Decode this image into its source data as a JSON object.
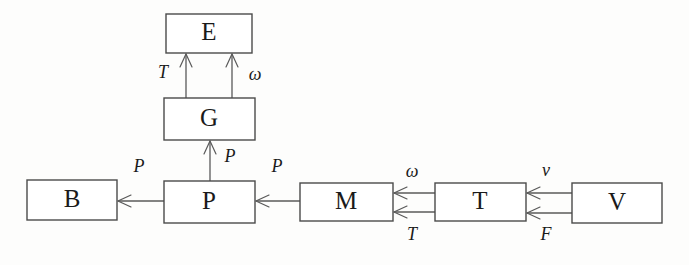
{
  "diagram": {
    "background_color": "#fdfdfc",
    "line_color": "#5a5a5a",
    "box_fill": "#ffffff",
    "text_color": "#1a1a1a",
    "nodes": [
      {
        "id": "E",
        "label": "E",
        "x": 166,
        "y": 14,
        "w": 86,
        "h": 39,
        "cx": 209,
        "cy": 33
      },
      {
        "id": "G",
        "label": "G",
        "x": 164,
        "y": 98,
        "w": 91,
        "h": 42,
        "cx": 209,
        "cy": 119
      },
      {
        "id": "B",
        "label": "B",
        "x": 27,
        "y": 180,
        "w": 90,
        "h": 40,
        "cx": 72,
        "cy": 200
      },
      {
        "id": "P",
        "label": "P",
        "x": 164,
        "y": 181,
        "w": 91,
        "h": 42,
        "cx": 209,
        "cy": 202
      },
      {
        "id": "M",
        "label": "M",
        "x": 300,
        "y": 183,
        "w": 93,
        "h": 38,
        "cx": 346,
        "cy": 202
      },
      {
        "id": "T",
        "label": "T",
        "x": 435,
        "y": 183,
        "w": 91,
        "h": 38,
        "cx": 480,
        "cy": 202
      },
      {
        "id": "V",
        "label": "V",
        "x": 572,
        "y": 183,
        "w": 90,
        "h": 40,
        "cx": 617,
        "cy": 203
      }
    ],
    "edges": [
      {
        "id": "G-to-E-left",
        "from": "G",
        "to": "E",
        "label": "T",
        "label_x": 163,
        "label_y": 74,
        "x1": 186,
        "y1": 98,
        "x2": 186,
        "y2": 54,
        "direction": "up"
      },
      {
        "id": "G-to-E-right",
        "from": "G",
        "to": "E",
        "label": "ω",
        "label_x": 255,
        "label_y": 76,
        "x1": 232,
        "y1": 98,
        "x2": 232,
        "y2": 54,
        "direction": "up"
      },
      {
        "id": "P-to-G",
        "from": "P",
        "to": "G",
        "label": "P",
        "label_x": 230,
        "label_y": 158,
        "x1": 210,
        "y1": 181,
        "x2": 210,
        "y2": 141,
        "direction": "up"
      },
      {
        "id": "P-to-B",
        "from": "P",
        "to": "B",
        "label": "P",
        "label_x": 139,
        "label_y": 168,
        "x1": 164,
        "y1": 201,
        "x2": 118,
        "y2": 201,
        "direction": "left"
      },
      {
        "id": "M-to-P",
        "from": "M",
        "to": "P",
        "label": "P",
        "label_x": 277,
        "label_y": 168,
        "x1": 300,
        "y1": 201,
        "x2": 256,
        "y2": 201,
        "direction": "left"
      },
      {
        "id": "T-to-M-upper",
        "from": "T",
        "to": "M",
        "label": "ω",
        "label_x": 412,
        "label_y": 173,
        "x1": 435,
        "y1": 193,
        "x2": 394,
        "y2": 193,
        "direction": "left"
      },
      {
        "id": "T-to-M-lower",
        "from": "T",
        "to": "M",
        "label": "T",
        "label_x": 412,
        "label_y": 236,
        "x1": 435,
        "y1": 212,
        "x2": 394,
        "y2": 212,
        "direction": "left"
      },
      {
        "id": "V-to-T-upper",
        "from": "V",
        "to": "T",
        "label": "v",
        "label_x": 546,
        "label_y": 172,
        "x1": 572,
        "y1": 193,
        "x2": 527,
        "y2": 193,
        "direction": "left"
      },
      {
        "id": "V-to-T-lower",
        "from": "V",
        "to": "T",
        "label": "F",
        "label_x": 546,
        "label_y": 236,
        "x1": 572,
        "y1": 213,
        "x2": 527,
        "y2": 213,
        "direction": "left"
      }
    ]
  }
}
